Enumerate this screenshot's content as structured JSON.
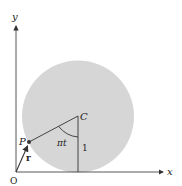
{
  "diagram": {
    "type": "geometry",
    "colors": {
      "disk_fill": "#d6d6d6",
      "line": "#333333",
      "axis": "#444444",
      "text": "#222222"
    },
    "axes": {
      "x_label": "x",
      "y_label": "y",
      "origin_label": "O"
    },
    "points": {
      "center_label": "C",
      "point_label": "P"
    },
    "vector_label": "r",
    "angle_label": "πt",
    "radius_label": "1"
  }
}
